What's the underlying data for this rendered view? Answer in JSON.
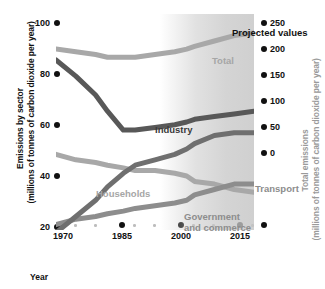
{
  "chart_data": {
    "type": "line",
    "title": "",
    "annotation": "Projected values",
    "xlabel": "Year",
    "ylabel_left": "Emissions by sector\n(millions of tonnes of carbon dioxide per year)",
    "ylabel_right": "Total emissions\n(millions of tonnes of carbon dioxide per year)",
    "xlim": [
      1970,
      2020
    ],
    "xticks": [
      1970,
      1985,
      2000,
      2015
    ],
    "xticks_minor": [
      1975,
      1980,
      1990,
      1995,
      2005,
      2010,
      2020
    ],
    "ylim_left": [
      20,
      100
    ],
    "yticks_left": [
      100,
      80,
      60,
      40,
      20
    ],
    "ylim_right": [
      0,
      250
    ],
    "yticks_right": [
      250,
      200,
      150,
      100,
      50,
      0
    ],
    "grid": false,
    "legend": "inline-labels",
    "projection_start_year": 2003,
    "x": [
      1970,
      1975,
      1980,
      1983,
      1987,
      1990,
      1995,
      2000,
      2003,
      2005,
      2010,
      2015,
      2020
    ],
    "series": [
      {
        "name": "Total",
        "axis": "right",
        "color": "#a8a8a8",
        "values_left_scale": [
          87,
          86,
          85,
          84,
          84,
          84,
          85,
          86,
          87,
          88,
          90,
          92,
          93
        ]
      },
      {
        "name": "Industry",
        "axis": "left",
        "color": "#585858",
        "values_left_scale": [
          83,
          77,
          70,
          64,
          57,
          57,
          58,
          59,
          60,
          61,
          62,
          63,
          64
        ]
      },
      {
        "name": "Households",
        "axis": "left",
        "color": "#a8a8a8",
        "values_left_scale": [
          48,
          46,
          45,
          44,
          43,
          42,
          42,
          41,
          40,
          38,
          37,
          35,
          34
        ]
      },
      {
        "name": "Government and commerce",
        "axis": "left",
        "color": "#8d8d8d",
        "values_left_scale": [
          22,
          24,
          25,
          26,
          27,
          28,
          29,
          30,
          31,
          33,
          35,
          37,
          37
        ]
      },
      {
        "name": "Transport",
        "axis": "left",
        "color": "#6f6f6f",
        "values_left_scale": [
          19,
          25,
          31,
          36,
          41,
          44,
          46,
          48,
          50,
          52,
          55,
          56,
          56
        ]
      }
    ]
  },
  "labels": {
    "total": "Total",
    "industry": "Industry",
    "households": "Households",
    "transport": "Transport",
    "government": "Government\nand commerce",
    "projected": "Projected values",
    "government_line1": "Government",
    "government_line2": "and commerce",
    "xlabel": "Year",
    "ylabel_left_line1": "Emissions by sector",
    "ylabel_left_line2": "(millions of tonnes of carbon dioxide per year)",
    "ylabel_right_line1": "Total emissions",
    "ylabel_right_line2": "(millions of tonnes of carbon dioxide per year)"
  },
  "ticks": {
    "left": [
      "100",
      "80",
      "60",
      "40",
      "20"
    ],
    "right": [
      "250",
      "200",
      "150",
      "100",
      "50",
      "0"
    ],
    "x": [
      "1970",
      "1985",
      "2000",
      "2015"
    ]
  },
  "colors": {
    "total": "#a8a8a8",
    "industry": "#585858",
    "households": "#a8a8a8",
    "government": "#8d8d8d",
    "transport": "#6f6f6f",
    "text": "#111111",
    "muted": "#9a9a9a"
  }
}
